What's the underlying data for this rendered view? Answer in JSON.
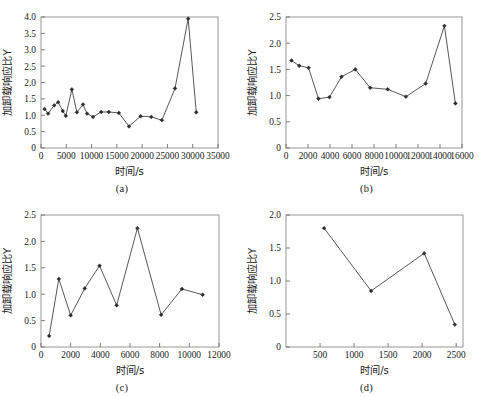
{
  "figure": {
    "panels": [
      {
        "id": "a",
        "caption": "(a)",
        "chart_data": {
          "type": "line",
          "title": "",
          "xlabel": "时间/s",
          "ylabel": "加卸载响应比Y",
          "xlim": [
            0,
            35000
          ],
          "ylim": [
            0,
            4.0
          ],
          "xticks": [
            0,
            5000,
            10000,
            15000,
            20000,
            25000,
            30000,
            35000
          ],
          "xticklabels": [
            "0",
            "5000",
            "10000",
            "15000",
            "20000",
            "25000",
            "30000",
            "35000"
          ],
          "yticks": [
            0,
            0.5,
            1.0,
            1.5,
            2.0,
            2.5,
            3.0,
            3.5,
            4.0
          ],
          "yticklabels": [
            "0",
            "0.5",
            "1.0",
            "1.5",
            "2.0",
            "2.5",
            "3.0",
            "3.5",
            "4.0"
          ],
          "grid": false,
          "legend": "none",
          "marker": "diamond",
          "x": [
            700,
            1400,
            2600,
            3400,
            4300,
            4900,
            6100,
            7100,
            8300,
            9100,
            10300,
            11900,
            13400,
            15400,
            17400,
            19700,
            21800,
            23900,
            26500,
            29100,
            30700
          ],
          "y": [
            1.19,
            1.05,
            1.3,
            1.4,
            1.13,
            0.98,
            1.79,
            1.09,
            1.33,
            1.05,
            0.95,
            1.1,
            1.1,
            1.07,
            0.66,
            0.97,
            0.95,
            0.85,
            1.82,
            3.95,
            1.09
          ]
        }
      },
      {
        "id": "b",
        "caption": "(b)",
        "chart_data": {
          "type": "line",
          "title": "",
          "xlabel": "时间/s",
          "ylabel": "加卸载响应比Y",
          "xlim": [
            0,
            16000
          ],
          "ylim": [
            0,
            2.5
          ],
          "xticks": [
            0,
            2000,
            4000,
            6000,
            8000,
            10000,
            12000,
            14000,
            16000
          ],
          "xticklabels": [
            "0",
            "2000",
            "4000",
            "6000",
            "8000",
            "10000",
            "12000",
            "14000",
            "16000"
          ],
          "yticks": [
            0,
            0.5,
            1.0,
            1.5,
            2.0,
            2.5
          ],
          "yticklabels": [
            "0",
            "0.5",
            "1.0",
            "1.5",
            "2.0",
            "2.5"
          ],
          "grid": false,
          "legend": "none",
          "marker": "diamond",
          "x": [
            500,
            1200,
            2050,
            2950,
            3950,
            5050,
            6300,
            7650,
            9250,
            10900,
            12700,
            14400,
            15400
          ],
          "y": [
            1.67,
            1.57,
            1.53,
            0.94,
            0.97,
            1.36,
            1.5,
            1.15,
            1.12,
            0.98,
            1.23,
            2.33,
            0.85
          ]
        }
      },
      {
        "id": "c",
        "caption": "(c)",
        "chart_data": {
          "type": "line",
          "title": "",
          "xlabel": "时间/s",
          "ylabel": "加卸载响应比Y",
          "xlim": [
            0,
            12000
          ],
          "ylim": [
            0,
            2.5
          ],
          "xticks": [
            0,
            2000,
            4000,
            6000,
            8000,
            10000,
            12000
          ],
          "xticklabels": [
            "0",
            "2000",
            "4000",
            "6000",
            "8000",
            "10000",
            "12000"
          ],
          "yticks": [
            0,
            0.5,
            1.0,
            1.5,
            2.0,
            2.5
          ],
          "yticklabels": [
            "0",
            "0.5",
            "1.0",
            "1.5",
            "2.0",
            "2.5"
          ],
          "grid": false,
          "legend": "none",
          "marker": "diamond",
          "x": [
            550,
            1200,
            2000,
            2950,
            3950,
            5100,
            6500,
            8100,
            9500,
            10900
          ],
          "y": [
            0.21,
            1.29,
            0.6,
            1.11,
            1.54,
            0.79,
            2.25,
            0.61,
            1.1,
            0.99
          ]
        }
      },
      {
        "id": "d",
        "caption": "(d)",
        "chart_data": {
          "type": "line",
          "title": "",
          "xlabel": "时间/s",
          "ylabel": "加卸载响应比Y",
          "xlim": [
            0,
            2600
          ],
          "ylim": [
            0,
            2.0
          ],
          "xticks": [
            500,
            1000,
            1500,
            2000,
            2500
          ],
          "xticklabels": [
            "500",
            "1000",
            "1500",
            "2000",
            "2500"
          ],
          "yticks": [
            0,
            0.5,
            1.0,
            1.5,
            2.0
          ],
          "yticklabels": [
            "0",
            "0.5",
            "1.0",
            "1.5",
            "2.0"
          ],
          "grid": false,
          "legend": "none",
          "marker": "diamond",
          "x": [
            560,
            1250,
            2030,
            2480
          ],
          "y": [
            1.8,
            0.85,
            1.42,
            0.34
          ]
        }
      }
    ]
  },
  "colors": {
    "background": "#ffffff",
    "frame": "#8d8d8d",
    "line": "#3a3a3a",
    "marker": "#2b2b2b",
    "text": "#1a1a1a"
  }
}
